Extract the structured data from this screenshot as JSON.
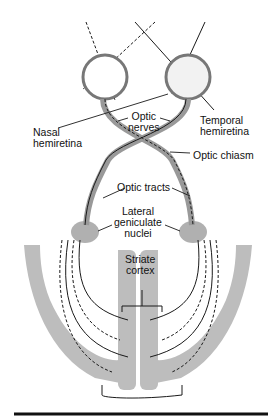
{
  "diagram": {
    "labels": {
      "optic_nerves": [
        "Optic",
        "nerves"
      ],
      "temporal_hemiretina": [
        "Temporal",
        "hemiretina"
      ],
      "nasal_hemiretina": [
        "Nasal",
        "hemiretina"
      ],
      "optic_chiasm": "Optic chiasm",
      "optic_tracts": "Optic tracts",
      "lateral_geniculate_nuclei": [
        "Lateral",
        "geniculate",
        "nuclei"
      ],
      "striate_cortex": [
        "Striate",
        "cortex"
      ]
    },
    "colors": {
      "line": "#1a1a1a",
      "tissue": "#b9b9b9",
      "tissue_dark": "#a5a5a5",
      "background": "#ffffff"
    }
  }
}
